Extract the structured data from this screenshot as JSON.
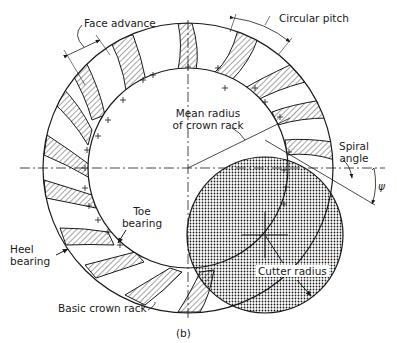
{
  "figure": {
    "caption": "(b)",
    "labels": {
      "face_advance": "Face advance",
      "circular_pitch": "Circular pitch",
      "mean_radius_line1": "Mean radius",
      "mean_radius_line2": "of crown rack",
      "spiral_angle_line1": "Spiral",
      "spiral_angle_line2": "angle",
      "psi_symbol": "ψ",
      "toe_bearing_line1": "Toe",
      "toe_bearing_line2": "bearing",
      "heel_bearing_line1": "Heel",
      "heel_bearing_line2": "bearing",
      "cutter_radius": "Cutter radius",
      "basic_crown_rack": "Basic crown rack"
    },
    "colors": {
      "ink": "#1a1a1a",
      "background": "#ffffff"
    }
  }
}
